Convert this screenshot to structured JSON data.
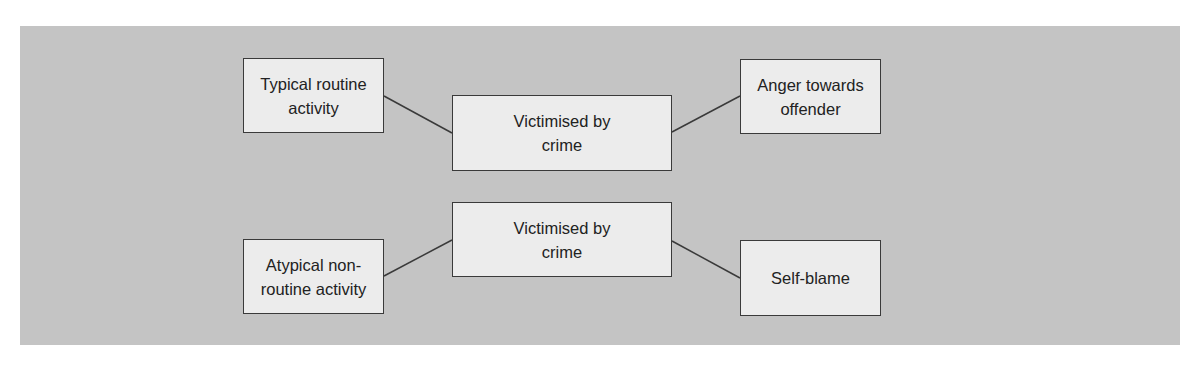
{
  "diagram": {
    "colors": {
      "panel": "#c4c4c4",
      "box_fill": "#ececec",
      "border": "#3a3a3a",
      "text": "#222222"
    },
    "nodes": [
      {
        "id": "typical",
        "label": "Typical routine activity"
      },
      {
        "id": "victim_top",
        "label": "Victimised by crime"
      },
      {
        "id": "anger",
        "label": "Anger towards offender"
      },
      {
        "id": "atypical",
        "label": "Atypical non-routine activity"
      },
      {
        "id": "victim_bottom",
        "label": "Victimised by crime"
      },
      {
        "id": "selfblame",
        "label": "Self-blame"
      }
    ],
    "edges": [
      {
        "from": "typical",
        "to": "victim_top"
      },
      {
        "from": "victim_top",
        "to": "anger"
      },
      {
        "from": "atypical",
        "to": "victim_bottom"
      },
      {
        "from": "victim_bottom",
        "to": "selfblame"
      }
    ]
  }
}
